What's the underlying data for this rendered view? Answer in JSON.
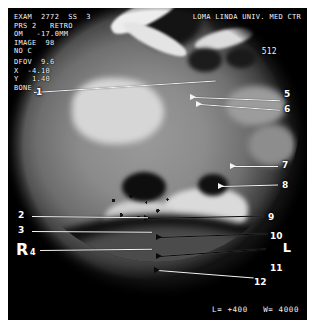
{
  "viewer": {
    "modality": "ct-scan",
    "header_left": "EXAM  2772  SS  3\nPRS 2   RETRO\nOM   -17.0MM\nIMAGE  98\nNO C",
    "header_right": "LOMA LINDA UNIV. MED CTR",
    "matrix": "512",
    "technique_block": "DFOV  9.6\nX  -4.10\nY   1.40\nBONE",
    "status_bar": "L= +400   W= 4000",
    "orientation_right": "R",
    "orientation_left": "L",
    "accent": "#f4f4f4",
    "background": "#000000"
  },
  "annotations": [
    {
      "id": "1",
      "label": "1"
    },
    {
      "id": "2",
      "label": "2"
    },
    {
      "id": "3",
      "label": "3"
    },
    {
      "id": "4",
      "label": "4"
    },
    {
      "id": "5",
      "label": "5"
    },
    {
      "id": "6",
      "label": "6"
    },
    {
      "id": "7",
      "label": "7"
    },
    {
      "id": "8",
      "label": "8"
    },
    {
      "id": "9",
      "label": "9"
    },
    {
      "id": "10",
      "label": "10"
    },
    {
      "id": "11",
      "label": "11"
    },
    {
      "id": "12",
      "label": "12"
    }
  ]
}
